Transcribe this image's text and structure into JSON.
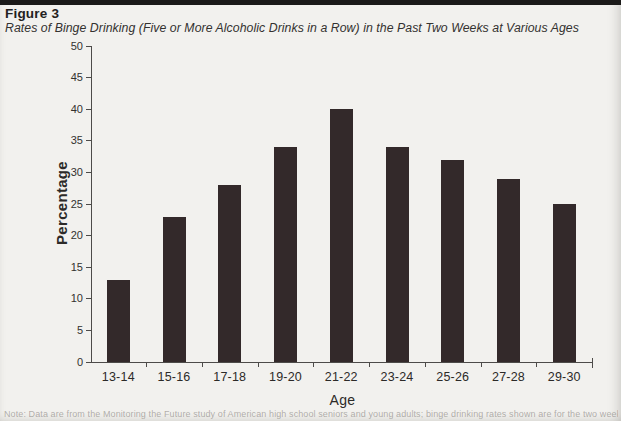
{
  "header": {
    "figure_label": "Figure 3",
    "caption": "Rates of Binge Drinking (Five or More Alcoholic Drinks in a Row) in the Past Two Weeks at Various Ages"
  },
  "chart_data": {
    "type": "bar",
    "title": "Rates of Binge Drinking (Five or More Alcoholic Drinks in a Row) in the Past Two Weeks at Various Ages",
    "categories": [
      "13-14",
      "15-16",
      "17-18",
      "19-20",
      "21-22",
      "23-24",
      "25-26",
      "27-28",
      "29-30"
    ],
    "values": [
      13,
      23,
      28,
      34,
      40,
      34,
      32,
      29,
      25
    ],
    "xlabel": "Age",
    "ylabel": "Percentage",
    "ylim": [
      0,
      50
    ],
    "ytick_step": 5,
    "grid": false,
    "legend": "none",
    "bar_color": "#33292a",
    "axis_color": "#4d4b49",
    "text_color": "#2c2a28",
    "background_color": "#f2f1ee"
  },
  "footnote": "Note: Data are from the Monitoring the Future study of American high school seniors and young adults; binge drinking rates shown are for the two weeks prior to each survey."
}
